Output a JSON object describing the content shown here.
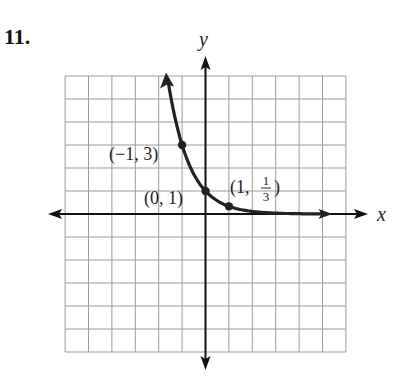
{
  "problem_number": "11.",
  "chart_data": {
    "type": "line",
    "title": "",
    "function": "y = (1/3)^x",
    "xlabel": "x",
    "ylabel": "y",
    "xlim": [
      -6,
      6
    ],
    "ylim": [
      -6,
      6
    ],
    "grid": true,
    "grid_step": 1,
    "series": [
      {
        "name": "y = (1/3)^x",
        "x": [
          -1.7,
          -1.5,
          -1,
          -0.5,
          0,
          0.5,
          1,
          2,
          3,
          4,
          5.2
        ],
        "y": [
          6.47,
          5.2,
          3,
          1.73,
          1,
          0.577,
          0.333,
          0.111,
          0.037,
          0.012,
          0.003
        ]
      }
    ],
    "points": [
      {
        "x": -1,
        "y": 3,
        "label": "(−1, 3)"
      },
      {
        "x": 0,
        "y": 1,
        "label": "(0, 1)"
      },
      {
        "x": 1,
        "y": 0.3333,
        "label_prefix": "(1, ",
        "label_num": "1",
        "label_den": "3",
        "label_suffix": ")"
      }
    ],
    "colors": {
      "grid": "#9a9a9a",
      "axis": "#111111",
      "curve": "#222222"
    }
  }
}
